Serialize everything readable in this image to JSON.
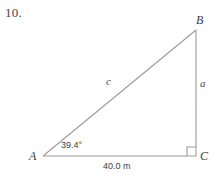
{
  "figure": {
    "problem_number": "10.",
    "shape": "right-triangle",
    "vertices": [
      {
        "id": "A",
        "label": "A",
        "x": 43,
        "y": 156
      },
      {
        "id": "B",
        "label": "B",
        "x": 196,
        "y": 30
      },
      {
        "id": "C",
        "label": "C",
        "x": 196,
        "y": 156
      }
    ],
    "sides": [
      {
        "id": "c",
        "label": "c",
        "from": "A",
        "to": "B",
        "role": "hypotenuse"
      },
      {
        "id": "a",
        "label": "a",
        "from": "B",
        "to": "C",
        "role": "opposite"
      },
      {
        "id": "b",
        "label": "40.0 m",
        "from": "A",
        "to": "C",
        "role": "adjacent"
      }
    ],
    "angles": [
      {
        "at": "A",
        "label": "39.4°",
        "value": 39.4,
        "unit": "degrees"
      },
      {
        "at": "C",
        "label": "",
        "value": 90,
        "unit": "degrees",
        "marker": "right-angle-square"
      }
    ],
    "base_measure": "40.0 m",
    "colors": {
      "stroke": "#9a9a9a",
      "text": "#3d3d3d",
      "background": "#ffffff"
    }
  }
}
